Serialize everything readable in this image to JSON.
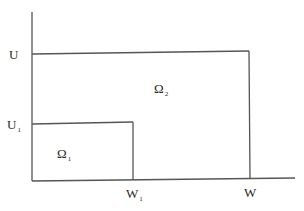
{
  "diagram": {
    "type": "nested-regions",
    "axes": {
      "y_ticks": [
        {
          "id": "U",
          "base": "U",
          "sub": ""
        },
        {
          "id": "U1",
          "base": "U",
          "sub": "1"
        }
      ],
      "x_ticks": [
        {
          "id": "W1",
          "base": "W",
          "sub": "1"
        },
        {
          "id": "W",
          "base": "W",
          "sub": ""
        }
      ]
    },
    "regions": [
      {
        "id": "omega1",
        "base": "Ω",
        "sub": "1",
        "bounds": "[0,W1]×[0,U1]"
      },
      {
        "id": "omega2",
        "base": "Ω",
        "sub": "2",
        "bounds": "[0,W]×[0,U]"
      }
    ],
    "line_color": "#555555"
  }
}
